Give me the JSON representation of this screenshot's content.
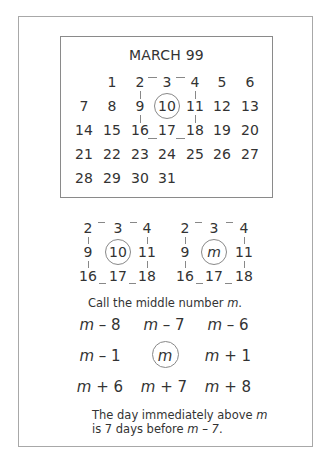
{
  "calendar": {
    "title": "MARCH 99",
    "rows": [
      [
        "",
        "1",
        "2",
        "3",
        "4",
        "5",
        "6"
      ],
      [
        "7",
        "8",
        "9",
        "10",
        "11",
        "12",
        "13"
      ],
      [
        "14",
        "15",
        "16",
        "17",
        "18",
        "19",
        "20"
      ],
      [
        "21",
        "22",
        "23",
        "24",
        "25",
        "26",
        "27"
      ],
      [
        "28",
        "29",
        "30",
        "31",
        "",
        "",
        ""
      ]
    ],
    "circled_day": "10"
  },
  "mini_grid_numbers": {
    "rows": [
      [
        "2",
        "3",
        "4"
      ],
      [
        "9",
        "10",
        "11"
      ],
      [
        "16",
        "17",
        "18"
      ]
    ]
  },
  "mini_grid_variable": {
    "rows": [
      [
        "2",
        "3",
        "4"
      ],
      [
        "9",
        "m",
        "11"
      ],
      [
        "16",
        "17",
        "18"
      ]
    ]
  },
  "caption_top": {
    "text": "Call the middle number ",
    "var": "m",
    "end": "."
  },
  "expressions": {
    "rows": [
      [
        "m – 8",
        "m – 7",
        "m – 6"
      ],
      [
        "m – 1",
        "m",
        "m + 1"
      ],
      [
        "m + 6",
        "m + 7",
        "m + 8"
      ]
    ]
  },
  "caption_bottom": {
    "line1_text": "The day immediately above ",
    "line1_var": "m",
    "line2_text": "is 7 days before ",
    "line2_var": "m – 7",
    "line2_end": "."
  },
  "colors": {
    "text": "#333333",
    "lines": "#888888",
    "border": "#a8a8a8"
  }
}
